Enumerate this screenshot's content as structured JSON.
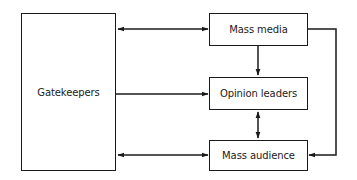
{
  "diagram": {
    "nodes": [
      {
        "id": "gatekeepers",
        "label": "Gatekeepers"
      },
      {
        "id": "mass_media",
        "label": "Mass media"
      },
      {
        "id": "opinion_leaders",
        "label": "Opinion leaders"
      },
      {
        "id": "mass_audience",
        "label": "Mass audience"
      }
    ],
    "edges": [
      {
        "from": "gatekeepers",
        "to": "mass_media",
        "direction": "both"
      },
      {
        "from": "gatekeepers",
        "to": "opinion_leaders",
        "direction": "forward"
      },
      {
        "from": "gatekeepers",
        "to": "mass_audience",
        "direction": "both"
      },
      {
        "from": "mass_media",
        "to": "opinion_leaders",
        "direction": "forward"
      },
      {
        "from": "opinion_leaders",
        "to": "mass_audience",
        "direction": "both"
      },
      {
        "from": "mass_media",
        "to": "mass_audience",
        "direction": "forward",
        "route": "right-side elbow"
      }
    ],
    "colors": {
      "stroke": "#1a1a1a",
      "background": "#ffffff"
    }
  }
}
